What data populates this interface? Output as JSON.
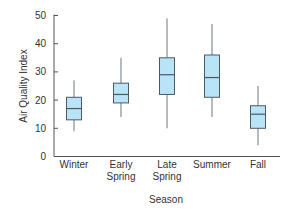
{
  "chart_data": {
    "type": "box",
    "title": "",
    "xlabel": "Season",
    "ylabel": "Air Quality Index",
    "ylim": [
      0,
      50
    ],
    "yticks": [
      0,
      10,
      20,
      30,
      40,
      50
    ],
    "grid": false,
    "legend": null,
    "categories": [
      [
        "Winter"
      ],
      [
        "Early",
        "Spring"
      ],
      [
        "Late",
        "Spring"
      ],
      [
        "Summer"
      ],
      [
        "Fall"
      ]
    ],
    "category_names": [
      "Winter",
      "Early Spring",
      "Late Spring",
      "Summer",
      "Fall"
    ],
    "boxes": [
      {
        "name": "Winter",
        "min": 9,
        "q1": 13,
        "median": 17,
        "q3": 21,
        "max": 27
      },
      {
        "name": "Early Spring",
        "min": 14,
        "q1": 19,
        "median": 22,
        "q3": 26,
        "max": 35
      },
      {
        "name": "Late Spring",
        "min": 10,
        "q1": 22,
        "median": 29,
        "q3": 35,
        "max": 49
      },
      {
        "name": "Summer",
        "min": 14,
        "q1": 21,
        "median": 28,
        "q3": 36,
        "max": 47
      },
      {
        "name": "Fall",
        "min": 4,
        "q1": 10,
        "median": 15,
        "q3": 18,
        "max": 25
      }
    ],
    "colors": {
      "box_fill": "#b9e3f6",
      "box_stroke": "#4d5a63",
      "whisker": "#6b7680",
      "axis": "#555555"
    }
  }
}
